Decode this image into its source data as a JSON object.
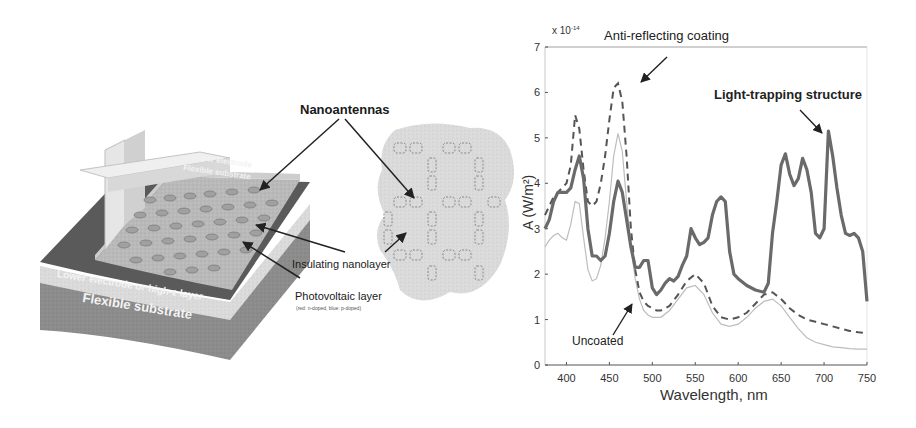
{
  "diagram": {
    "labels": {
      "nanoantennas": "Nanoantennas",
      "insulating": "Insulating nanolayer",
      "photovoltaic": "Photovoltaic layer",
      "photovoltaic_sub": "(red: n-doped, blue: p-doped)",
      "lower_electrode": "Lower electrode or high-ε layer",
      "flexible_substrate": "Flexible substrate",
      "upper_electrode": "Upper electrode",
      "flexible_substrate_top": "Flexible substrate"
    }
  },
  "chart_data": {
    "type": "line",
    "title": "",
    "xlabel": "Wavelength, nm",
    "ylabel": "A (W/m²)",
    "y_multiplier": "x 10^-14",
    "y_multiplier_base": "x 10",
    "y_multiplier_exp": "-14",
    "xlim": [
      375,
      750
    ],
    "ylim": [
      0,
      7
    ],
    "xticks": [
      400,
      450,
      500,
      550,
      600,
      650,
      700,
      750
    ],
    "yticks": [
      0,
      1,
      2,
      3,
      4,
      5,
      6,
      7
    ],
    "grid": false,
    "annotations": [
      {
        "text": "Anti-reflecting coating",
        "points_to": "dashed peak ~465 nm"
      },
      {
        "text": "Light-trapping structure",
        "points_to": "solid peak ~705 nm",
        "bold": true
      },
      {
        "text": "Uncoated",
        "points_to": "thin curve ~480 nm"
      }
    ],
    "series": [
      {
        "name": "Light-trapping structure",
        "style": "solid-thick",
        "x": [
          375,
          380,
          385,
          390,
          395,
          400,
          405,
          410,
          415,
          420,
          425,
          430,
          435,
          440,
          445,
          450,
          455,
          460,
          465,
          470,
          475,
          480,
          485,
          490,
          495,
          500,
          505,
          510,
          515,
          520,
          525,
          530,
          535,
          540,
          545,
          550,
          555,
          560,
          565,
          570,
          575,
          580,
          585,
          590,
          595,
          600,
          610,
          620,
          630,
          635,
          640,
          645,
          650,
          655,
          660,
          665,
          670,
          675,
          680,
          685,
          690,
          695,
          700,
          705,
          710,
          715,
          720,
          725,
          730,
          735,
          740,
          745,
          750
        ],
        "values": [
          3.0,
          3.2,
          3.6,
          3.8,
          3.8,
          3.8,
          3.9,
          4.3,
          4.6,
          4.1,
          3.0,
          2.4,
          2.4,
          2.3,
          2.4,
          2.9,
          3.6,
          4.05,
          3.8,
          3.2,
          2.6,
          2.15,
          2.15,
          2.3,
          2.3,
          1.7,
          1.55,
          1.65,
          1.8,
          1.9,
          1.85,
          1.95,
          2.2,
          2.4,
          3.0,
          2.8,
          2.65,
          2.7,
          2.8,
          3.3,
          3.6,
          3.7,
          3.6,
          2.5,
          2.0,
          1.9,
          1.75,
          1.65,
          1.6,
          1.8,
          2.9,
          3.6,
          4.4,
          4.65,
          4.2,
          3.95,
          4.1,
          4.55,
          4.3,
          3.8,
          2.9,
          2.8,
          3.0,
          5.15,
          4.6,
          3.9,
          3.3,
          2.9,
          2.85,
          2.9,
          2.8,
          2.5,
          1.4
        ]
      },
      {
        "name": "Anti-reflecting coating",
        "style": "dashed",
        "x": [
          375,
          385,
          395,
          400,
          405,
          410,
          415,
          420,
          425,
          430,
          435,
          440,
          445,
          450,
          455,
          460,
          465,
          470,
          475,
          480,
          485,
          490,
          495,
          500,
          505,
          510,
          520,
          530,
          540,
          550,
          560,
          570,
          580,
          590,
          600,
          610,
          620,
          630,
          640,
          650,
          660,
          670,
          680,
          690,
          700,
          710,
          720,
          730,
          740,
          750
        ],
        "values": [
          3.3,
          3.7,
          3.9,
          4.0,
          4.4,
          5.5,
          5.2,
          4.3,
          3.6,
          3.5,
          3.6,
          4.0,
          4.6,
          5.4,
          6.1,
          6.2,
          5.8,
          4.6,
          3.0,
          2.1,
          1.6,
          1.4,
          1.3,
          1.25,
          1.2,
          1.2,
          1.3,
          1.55,
          1.85,
          2.0,
          1.8,
          1.3,
          1.05,
          1.0,
          1.05,
          1.15,
          1.35,
          1.55,
          1.6,
          1.45,
          1.25,
          1.1,
          1.0,
          0.95,
          0.9,
          0.85,
          0.8,
          0.75,
          0.72,
          0.7
        ]
      },
      {
        "name": "Uncoated",
        "style": "solid-thin",
        "x": [
          375,
          380,
          385,
          390,
          395,
          400,
          405,
          410,
          415,
          420,
          425,
          430,
          435,
          440,
          445,
          450,
          455,
          460,
          465,
          470,
          475,
          480,
          485,
          490,
          495,
          500,
          510,
          520,
          530,
          540,
          550,
          560,
          570,
          580,
          590,
          600,
          610,
          620,
          630,
          640,
          650,
          660,
          670,
          680,
          690,
          700,
          710,
          720,
          730,
          740,
          750
        ],
        "values": [
          2.6,
          2.75,
          2.85,
          2.9,
          2.8,
          2.75,
          3.1,
          3.6,
          3.55,
          2.8,
          2.1,
          1.85,
          1.9,
          2.2,
          2.8,
          3.6,
          4.6,
          5.1,
          4.7,
          3.6,
          2.6,
          1.9,
          1.45,
          1.2,
          1.1,
          1.05,
          1.05,
          1.2,
          1.45,
          1.7,
          1.75,
          1.55,
          1.15,
          0.9,
          0.85,
          0.9,
          1.05,
          1.25,
          1.4,
          1.45,
          1.3,
          1.05,
          0.8,
          0.6,
          0.5,
          0.45,
          0.4,
          0.38,
          0.36,
          0.35,
          0.35
        ]
      }
    ]
  }
}
